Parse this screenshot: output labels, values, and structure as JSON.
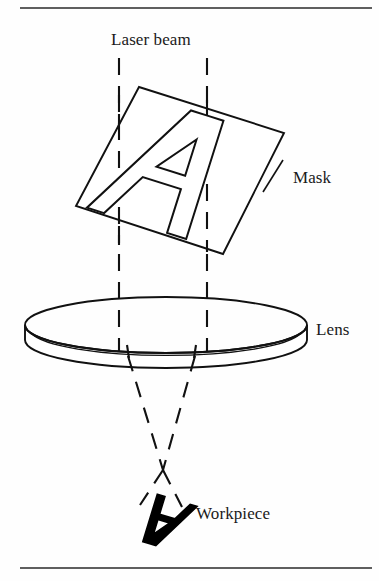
{
  "figure": {
    "labels": {
      "laser_beam": "Laser beam",
      "mask": "Mask",
      "lens": "Lens",
      "workpiece": "Workpiece"
    },
    "colors": {
      "ink": "#1a1a1a",
      "stroke": "#000000",
      "background": "#ffffff",
      "workpiece_fill": "#000000"
    }
  },
  "diagram_data": {
    "type": "schematic",
    "description": "Optical schematic: a collimated laser beam passes through a tilted square mask bearing a stencil letter A, is focused by a lens, crosses at the focal point and forms an inverted image of the letter A on the workpiece.",
    "elements": [
      {
        "name": "laser-beam",
        "kind": "dashed-ray-pair",
        "left_ray_x": 119,
        "right_ray_x": 207,
        "top_y": 58,
        "lens_y": 352,
        "crossing_point": [
          163,
          470
        ],
        "workpiece_y": 505
      },
      {
        "name": "mask",
        "kind": "tilted-square-outline",
        "corners": [
          [
            139,
            87
          ],
          [
            284,
            133
          ],
          [
            223,
            254
          ],
          [
            76,
            206
          ]
        ],
        "engraving": "A"
      },
      {
        "name": "lens",
        "kind": "disk",
        "center": [
          166,
          325
        ],
        "radius_x": 141,
        "radius_y": 28,
        "thickness": 26
      },
      {
        "name": "workpiece",
        "kind": "filled-letter",
        "engraving": "A",
        "rotation_degrees": 180,
        "center": [
          160,
          520
        ]
      },
      {
        "name": "rule-top",
        "kind": "horizontal-rule",
        "y": 8
      },
      {
        "name": "rule-bottom",
        "kind": "horizontal-rule",
        "y": 568
      }
    ]
  }
}
